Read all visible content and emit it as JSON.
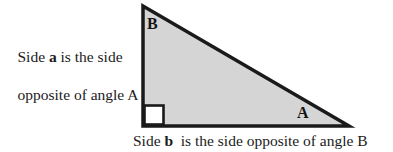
{
  "figure": {
    "type": "right-triangle-diagram",
    "fill_color": "#d5d5d5",
    "edge_color": "#1a1a1a",
    "background_color": "#ffffff",
    "vertices": {
      "top": [
        143,
        6
      ],
      "bottom_left": [
        143,
        126
      ],
      "bottom_right": [
        349,
        126
      ]
    },
    "edge_width": 3.5,
    "right_angle_marker": {
      "at": "bottom_left",
      "size": 20,
      "fill": "#ffffff",
      "stroke": "#1a1a1a"
    },
    "vertex_labels": {
      "top_angle": "B",
      "bottom_right_angle": "A"
    }
  },
  "captions": {
    "left": {
      "line1_before": "Side ",
      "line1_bold": "a",
      "line1_after": " is the side",
      "line2": "opposite of angle A"
    },
    "bottom": {
      "before": "Side ",
      "bold": "b",
      "after": "  is the side opposite of angle B"
    }
  }
}
